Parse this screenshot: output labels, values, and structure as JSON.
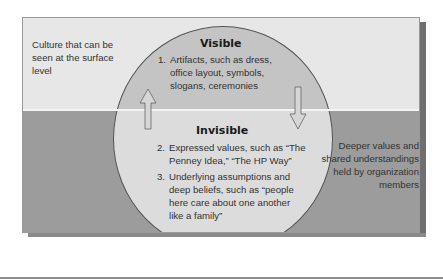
{
  "diagram": {
    "surface_label": "Culture that can be seen at the surface level",
    "deeper_label": "Deeper values and shared understandings held by organization members",
    "visible": {
      "heading": "Visible",
      "items": [
        {
          "number": "1.",
          "text": "Artifacts, such as dress, office layout, symbols, slogans, ceremonies"
        }
      ]
    },
    "invisible": {
      "heading": "Invisible",
      "items": [
        {
          "number": "2.",
          "text": "Expressed values, such as “The Penney Idea,” “The HP Way”"
        },
        {
          "number": "3.",
          "text": "Underlying assumptions and deep beliefs, such as “people here care about one another like a family”"
        }
      ]
    },
    "arrows": [
      {
        "direction": "up",
        "icon": "arrow-up-icon"
      },
      {
        "direction": "down",
        "icon": "arrow-down-icon"
      }
    ],
    "colors": {
      "surface_band": "#e7e7e7",
      "deep_band": "#9c9c9c",
      "circle_visible": "#c4c4c4",
      "circle_invisible": "#dcdcdc",
      "waterline": "#f4f4f4",
      "text": "#333333"
    }
  }
}
